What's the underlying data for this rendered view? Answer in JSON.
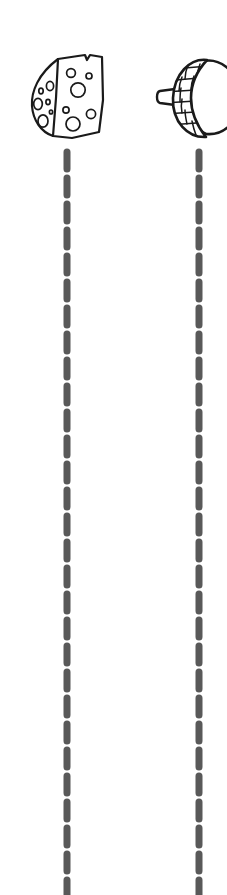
{
  "page": {
    "background_color": "#ffffff",
    "width": 227,
    "height": 895,
    "style": "black-and-white line art clip-art with dashed tracing trails"
  },
  "colors": {
    "outline": "#1a1a1a",
    "fill": "#ffffff",
    "dash": "#595959",
    "background": "#ffffff"
  },
  "items": [
    {
      "id": "cheese",
      "label": "Cheese wedge",
      "icon_name": "cheese-wedge-icon",
      "description": "Angular wedge of holey swiss cheese with a notched top edge, a vertical fold line dividing the rind side face from the cut face, and round holes on both faces",
      "column": "left",
      "center_x": 67,
      "top": 48,
      "outline_color": "#1a1a1a",
      "fill_color": "#ffffff",
      "holes_side_face": 7,
      "holes_cut_face": 7
    },
    {
      "id": "acorn",
      "label": "Acorn",
      "icon_name": "acorn-icon",
      "description": "Acorn lying on its side, cap with cross-hatched scale pattern on the left, short stem nub pointing left, smooth rounded nut body on the right",
      "column": "right",
      "center_x": 199,
      "top": 50,
      "outline_color": "#1a1a1a",
      "fill_color": "#ffffff",
      "cap_pattern": "scales"
    }
  ],
  "trails": [
    {
      "id": "trail-cheese",
      "for_item": "cheese",
      "label": "Dashed tracing trail below the cheese wedge",
      "center_x": 67,
      "start_y": 152,
      "end_y": 895,
      "dash_color": "#595959",
      "dash_length": 17,
      "dash_gap": 9,
      "dash_width": 7,
      "dash_count": 29,
      "orientation": "vertical",
      "runs_off_bottom": true
    },
    {
      "id": "trail-acorn",
      "for_item": "acorn",
      "label": "Dashed tracing trail below the acorn",
      "center_x": 199,
      "start_y": 152,
      "end_y": 895,
      "dash_color": "#595959",
      "dash_length": 17,
      "dash_gap": 9,
      "dash_width": 7,
      "dash_count": 29,
      "orientation": "vertical",
      "runs_off_bottom": true
    }
  ]
}
